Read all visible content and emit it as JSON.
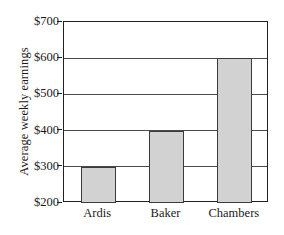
{
  "chart_data": {
    "type": "bar",
    "title": "",
    "subtitle": "",
    "xlabel": "",
    "ylabel": "Average weekly earnings",
    "categories": [
      "Ardis",
      "Baker",
      "Chambers"
    ],
    "values": [
      300,
      400,
      600
    ],
    "series": [
      {
        "name": "Average weekly earnings",
        "values": [
          300,
          400,
          600
        ]
      }
    ],
    "ylim": [
      200,
      700
    ],
    "ytick_values": [
      700,
      600,
      500,
      400,
      300,
      200
    ],
    "ytick_labels": [
      "$700",
      "$600",
      "$500",
      "$400",
      "$300",
      "$200"
    ],
    "xtick_labels": [
      "Ardis",
      "Baker",
      "Chambers"
    ],
    "grid": "horizontal",
    "legend": "none",
    "bar_fill_color": "#d2d2d2",
    "bar_edge_color": "#3b3b3b",
    "gridline_color": "#4a4a4a",
    "frame_color": "#231f20",
    "background_color": "#ffffff",
    "annotations": []
  }
}
